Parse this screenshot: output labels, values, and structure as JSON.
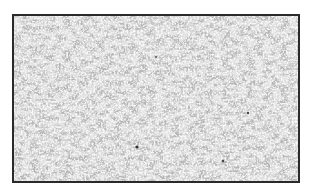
{
  "image": {
    "description": "granular grayscale texture inside a dark rectangular border",
    "colors": {
      "background": "#ffffff",
      "border": "#2a2a2a",
      "texture_base": "#bdbdbd",
      "texture_dark": "#8a8a8a",
      "texture_light": "#f2f2f2"
    }
  }
}
